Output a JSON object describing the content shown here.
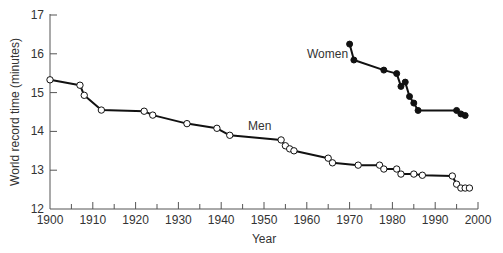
{
  "chart_data": {
    "type": "line",
    "title": "",
    "xlabel": "Year",
    "ylabel": "World record time (minutes)",
    "xlim": [
      1900,
      2000
    ],
    "ylim": [
      12,
      17
    ],
    "x_ticks": [
      1900,
      1910,
      1920,
      1930,
      1940,
      1950,
      1960,
      1970,
      1980,
      1990,
      2000
    ],
    "y_ticks": [
      12,
      13,
      14,
      15,
      16,
      17
    ],
    "grid": false,
    "legend": "inline labels",
    "series": [
      {
        "name": "Men",
        "marker": "open-circle",
        "x": [
          1900,
          1907,
          1908,
          1912,
          1922,
          1924,
          1932,
          1939,
          1942,
          1954,
          1955,
          1956,
          1957,
          1965,
          1966,
          1972,
          1977,
          1978,
          1981,
          1982,
          1985,
          1987,
          1994,
          1995,
          1996,
          1997,
          1998
        ],
        "values": [
          15.33,
          15.19,
          14.93,
          14.55,
          14.52,
          14.42,
          14.2,
          14.08,
          13.9,
          13.78,
          13.63,
          13.55,
          13.5,
          13.31,
          13.19,
          13.13,
          13.13,
          13.03,
          13.03,
          12.9,
          12.9,
          12.87,
          12.85,
          12.64,
          12.54,
          12.54,
          12.54
        ]
      },
      {
        "name": "Women",
        "marker": "filled-circle",
        "x": [
          1970,
          1971,
          1978,
          1981,
          1982,
          1983,
          1984,
          1985,
          1986,
          1995,
          1996,
          1997
        ],
        "values": [
          16.25,
          15.84,
          15.58,
          15.49,
          15.16,
          15.27,
          14.9,
          14.73,
          14.54,
          14.54,
          14.45,
          14.41
        ]
      }
    ],
    "annotations": [
      {
        "text": "Men",
        "x": 1950,
        "y": 14.05
      },
      {
        "text": "Women",
        "x": 1962,
        "y": 15.85
      }
    ]
  },
  "labels": {
    "xlabel": "Year",
    "ylabel": "World record time (minutes)",
    "men": "Men",
    "women": "Women"
  }
}
